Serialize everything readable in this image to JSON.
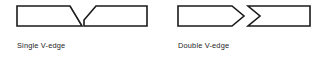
{
  "figure": {
    "background_color": "#ffffff",
    "line_color": "#1a1a1a",
    "fill_color": "#ffffff",
    "text_color": "#1c1c1c",
    "canvas": {
      "width": 322,
      "height": 60
    },
    "diagrams": [
      {
        "id": "single-v-edge",
        "caption": "Single V-edge",
        "caption_position": {
          "x": 17,
          "y": 48
        },
        "description": "Two mating plate sections separated by a single V shaped groove",
        "parts": [
          {
            "name": "left-plate-single-v",
            "shape": "trapezoid-bevel-right",
            "points": "17,6 70,6 82,26 17,26"
          },
          {
            "name": "right-plate-single-v",
            "shape": "trapezoid-bevel-left",
            "points": "84,26 84,20 96,6 147,6 147,26"
          }
        ]
      },
      {
        "id": "double-v-edge",
        "caption": "Double V-edge",
        "caption_position": {
          "x": 178,
          "y": 48
        },
        "description": "Two mating plate sections, one tapering to a point meeting a matching concave notch",
        "parts": [
          {
            "name": "left-plate-double-v",
            "shape": "chevron-point-right",
            "points": "178,6 232,6 244,16 232,26 178,26"
          },
          {
            "name": "right-plate-double-v",
            "shape": "notch-concave-left",
            "points": "248,6 310,6 310,26 248,26 260,16"
          }
        ]
      }
    ]
  }
}
